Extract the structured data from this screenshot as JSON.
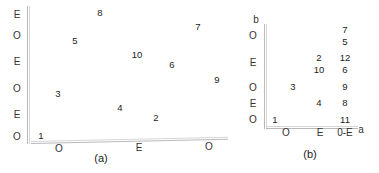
{
  "panels": [
    {
      "id": "a",
      "caption": "(a)",
      "y_axis_labels": [
        "E",
        "O",
        "E",
        "O",
        "E",
        "O"
      ],
      "x_axis_labels": [
        "O",
        "E",
        "O"
      ],
      "points": [
        {
          "label": "8"
        },
        {
          "label": "5"
        },
        {
          "label": "10"
        },
        {
          "label": "7"
        },
        {
          "label": "6"
        },
        {
          "label": "9"
        },
        {
          "label": "3"
        },
        {
          "label": "4"
        },
        {
          "label": "2"
        },
        {
          "label": "1"
        }
      ]
    },
    {
      "id": "b",
      "caption": "(b)",
      "y_axis_title": "b",
      "x_axis_title": "a",
      "y_axis_labels": [
        "O",
        "E",
        "O",
        "E",
        "O"
      ],
      "x_axis_labels": [
        "O",
        "E",
        "0-E"
      ],
      "points": [
        {
          "label": "7"
        },
        {
          "label": "5"
        },
        {
          "label": "2"
        },
        {
          "label": "12"
        },
        {
          "label": "10"
        },
        {
          "label": "6"
        },
        {
          "label": "3"
        },
        {
          "label": "9"
        },
        {
          "label": "4"
        },
        {
          "label": "8"
        },
        {
          "label": "1"
        },
        {
          "label": "11"
        }
      ]
    }
  ]
}
